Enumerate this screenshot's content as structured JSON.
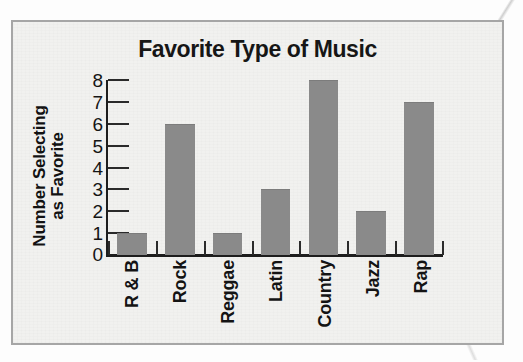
{
  "chart_data": {
    "type": "bar",
    "title": "Favorite Type of Music",
    "xlabel": "",
    "ylabel": "Number Selecting as Favorite",
    "ylabel_lines": [
      "Number Selecting",
      "as Favorite"
    ],
    "categories": [
      "R & B",
      "Rock",
      "Reggae",
      "Latin",
      "Country",
      "Jazz",
      "Rap"
    ],
    "values": [
      1,
      6,
      1,
      3,
      8,
      2,
      7
    ],
    "ylim": [
      0,
      8
    ],
    "ytick_labels": [
      "8",
      "7",
      "6",
      "5",
      "4",
      "3",
      "2",
      "1",
      "0"
    ],
    "ytick_values": [
      8,
      7,
      6,
      5,
      4,
      3,
      2,
      1,
      0
    ],
    "grid": false,
    "legend": false,
    "orientation": "vertical",
    "bar_color": "#8a8a8a",
    "axis_color": "#1d1d1d",
    "panel_background": "#f1f1ef",
    "panel_border_color": "#a6a6a6",
    "text_color": "#141414"
  }
}
